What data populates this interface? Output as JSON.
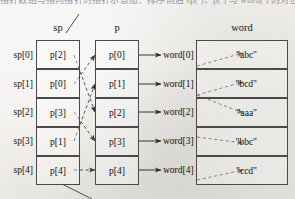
{
  "page": {
    "clipped_top_line": "指针数组与指向指针的指针示意图：排序前后 sp[ ]、p[ ] 与 word[ ] 的对应关系",
    "background_color": "#eceae6",
    "ink_color": "#1b1b1b"
  },
  "columns": {
    "sp": {
      "title": "sp"
    },
    "p": {
      "title": "p"
    },
    "word": {
      "title": "word"
    }
  },
  "sp_array": {
    "index_labels": [
      "sp[0]",
      "sp[1]",
      "sp[2]",
      "sp[3]",
      "sp[4]"
    ],
    "cells": [
      "p[2]",
      "p[0]",
      "p[3]",
      "p[1]",
      "p[4]"
    ]
  },
  "p_array": {
    "cells": [
      "p[0]",
      "p[1]",
      "p[2]",
      "p[3]",
      "p[4]"
    ],
    "targets": [
      "word[0]",
      "word[1]",
      "word[2]",
      "word[3]",
      "word[4]"
    ]
  },
  "word_array": {
    "values": [
      "\"abc\"",
      "\"bcd\"",
      "\"aaa\"",
      "\"bbc\"",
      "\"ccd\""
    ]
  },
  "connections": {
    "sp_to_p": [
      {
        "from": "sp[0]",
        "to": "p[2]"
      },
      {
        "from": "sp[1]",
        "to": "p[0]"
      },
      {
        "from": "sp[2]",
        "to": "p[3]"
      },
      {
        "from": "sp[3]",
        "to": "p[1]"
      },
      {
        "from": "sp[4]",
        "to": "p[4]"
      }
    ],
    "p_to_word": [
      {
        "from": "p[0]",
        "to": "\"abc\""
      },
      {
        "from": "p[1]",
        "to": "\"bcd\""
      },
      {
        "from": "p[2]",
        "to": "\"aaa\""
      },
      {
        "from": "p[3]",
        "to": "\"bbc\""
      },
      {
        "from": "p[4]",
        "to": "\"ccd\""
      }
    ],
    "leader_lines": [
      "sp-top-leader",
      "sp-bottom-leader"
    ]
  }
}
